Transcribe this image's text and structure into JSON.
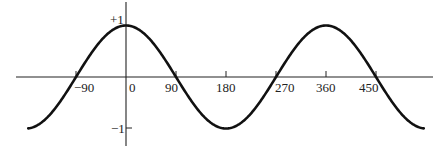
{
  "chart_data": {
    "type": "line",
    "title": "",
    "xlabel": "",
    "ylabel": "",
    "series": [
      {
        "name": "cos(x)",
        "function": "cos",
        "x_range": [
          -176,
          536
        ]
      }
    ],
    "x_ticks": [
      -90,
      0,
      90,
      180,
      270,
      360,
      450
    ],
    "x_tick_labels": [
      "−90",
      "0",
      "90",
      "180",
      "270",
      "360",
      "450"
    ],
    "y_ticks": [
      1,
      -1
    ],
    "y_tick_labels": [
      "+1",
      "−1"
    ],
    "xlim": [
      -197,
      555
    ],
    "ylim": [
      -1.3,
      1.35
    ],
    "grid": false,
    "legend": null,
    "x": [
      -180,
      -135,
      -90,
      -45,
      0,
      45,
      90,
      135,
      180,
      225,
      270,
      315,
      360,
      405,
      450,
      495,
      540
    ],
    "y": [
      -1,
      -0.707,
      0,
      0.707,
      1,
      0.707,
      0,
      -0.707,
      -1,
      -0.707,
      0,
      0.707,
      1,
      0.707,
      0,
      -0.707,
      -1
    ]
  },
  "labels": {
    "y_pos": "+1",
    "y_neg": "−1",
    "x": [
      "−90",
      "0",
      "90",
      "180",
      "270",
      "360",
      "450"
    ]
  }
}
